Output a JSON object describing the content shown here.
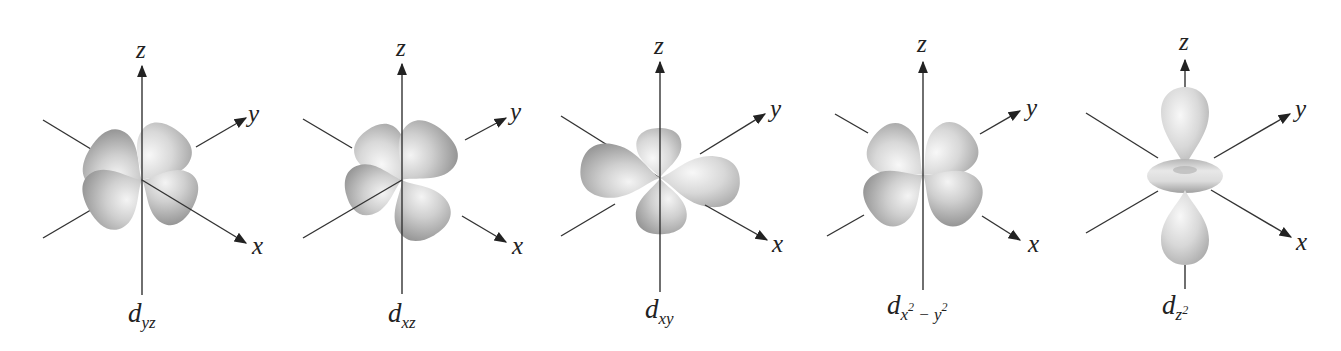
{
  "figure": {
    "colors": {
      "background": "#ffffff",
      "axis": "#333333",
      "lobe_light": "#f2f2f2",
      "lobe_mid": "#c8c8c8",
      "lobe_dark": "#9a9a9a"
    },
    "axis_labels": {
      "x": "x",
      "y": "y",
      "z": "z"
    },
    "orbitals": [
      {
        "id": "dyz",
        "main": "d",
        "sub": "yz",
        "sup": "",
        "sub2": "",
        "sup2": ""
      },
      {
        "id": "dxz",
        "main": "d",
        "sub": "xz",
        "sup": "",
        "sub2": "",
        "sup2": ""
      },
      {
        "id": "dxy",
        "main": "d",
        "sub": "xy",
        "sup": "",
        "sub2": "",
        "sup2": ""
      },
      {
        "id": "dx2-y2",
        "main": "d",
        "sub": "x",
        "sup": "2",
        "sub2": " − y",
        "sup2": "2"
      },
      {
        "id": "dz2",
        "main": "d",
        "sub": "z",
        "sup": "2",
        "sub2": "",
        "sup2": ""
      }
    ]
  }
}
